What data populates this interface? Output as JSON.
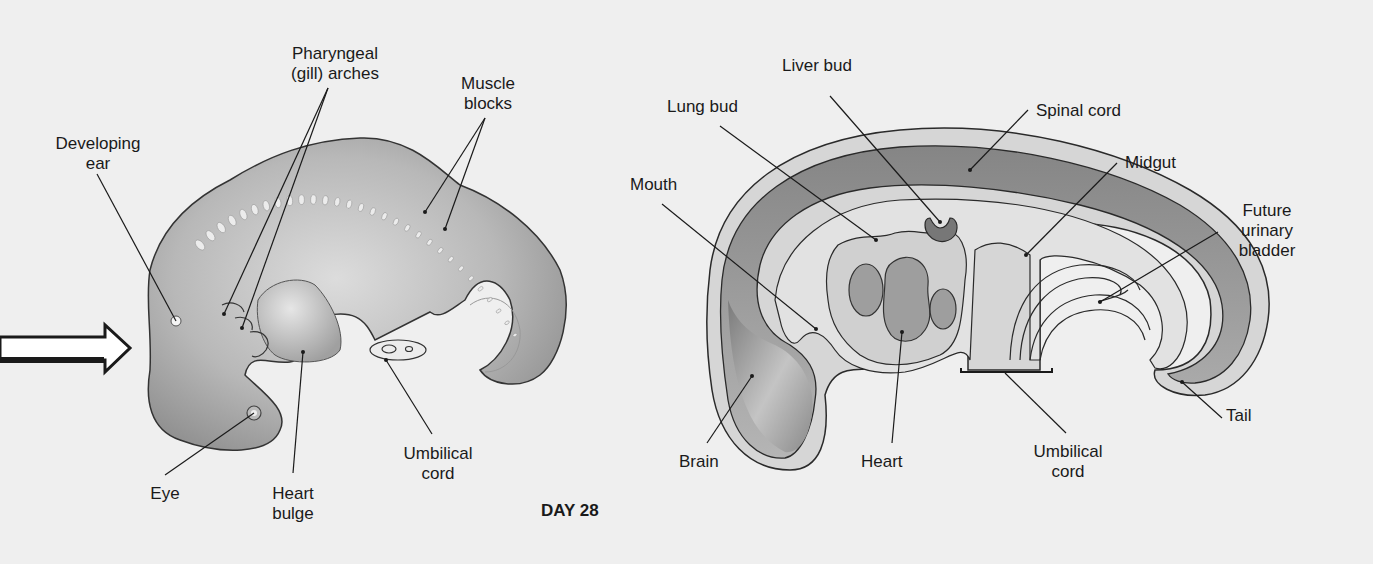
{
  "figure": {
    "caption": "DAY 28",
    "colors": {
      "background": "#efefef",
      "embryo_fill": "#b4b4b4",
      "embryo_highlight": "#e2e2e2",
      "outline": "#2a2a2a",
      "brain_fill": "#8e8e8e",
      "organ_fill": "#a6a6a6",
      "cavity_fill": "#d8d8d8"
    },
    "left_panel": {
      "view": "external",
      "arrow_icon": "right-arrow-icon",
      "labels": {
        "developing_ear": "Developing\near",
        "pharyngeal_arches": "Pharyngeal\n(gill) arches",
        "muscle_blocks": "Muscle\nblocks",
        "eye": "Eye",
        "heart_bulge": "Heart\nbulge",
        "umbilical_cord": "Umbilical\ncord"
      }
    },
    "right_panel": {
      "view": "sagittal section",
      "labels": {
        "liver_bud": "Liver bud",
        "lung_bud": "Lung bud",
        "spinal_cord": "Spinal cord",
        "mouth": "Mouth",
        "midgut": "Midgut",
        "future_urinary_bladder": "Future\nurinary\nbladder",
        "brain": "Brain",
        "heart": "Heart",
        "umbilical_cord": "Umbilical\ncord",
        "tail": "Tail"
      }
    }
  }
}
